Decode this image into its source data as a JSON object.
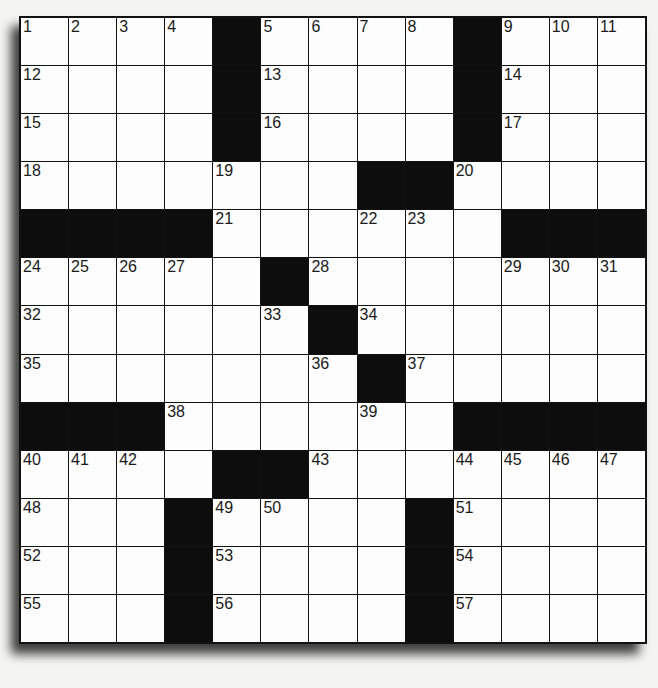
{
  "puzzle": {
    "size": 13,
    "colors": {
      "black": "#0d0d0d",
      "white": "#fdfdfd",
      "border": "#111111"
    },
    "grid": [
      [
        "1",
        "2",
        "3",
        "4",
        "#",
        "5",
        "6",
        "7",
        "8",
        "#",
        "9",
        "10",
        "11"
      ],
      [
        "12",
        "",
        "",
        "",
        "#",
        "13",
        "",
        "",
        "",
        "#",
        "14",
        "",
        ""
      ],
      [
        "15",
        "",
        "",
        "",
        "#",
        "16",
        "",
        "",
        "",
        "#",
        "17",
        "",
        ""
      ],
      [
        "18",
        "",
        "",
        "",
        "19",
        "",
        "",
        "#",
        "#",
        "20",
        "",
        "",
        ""
      ],
      [
        "#",
        "#",
        "#",
        "#",
        "21",
        "",
        "",
        "22",
        "23",
        "",
        "#",
        "#",
        "#"
      ],
      [
        "24",
        "25",
        "26",
        "27",
        "",
        "#",
        "28",
        "",
        "",
        "",
        "29",
        "30",
        "31"
      ],
      [
        "32",
        "",
        "",
        "",
        "",
        "33",
        "#",
        "34",
        "",
        "",
        "",
        "",
        ""
      ],
      [
        "35",
        "",
        "",
        "",
        "",
        "",
        "36",
        "#",
        "37",
        "",
        "",
        "",
        ""
      ],
      [
        "#",
        "#",
        "#",
        "38",
        "",
        "",
        "",
        "39",
        "",
        "#",
        "#",
        "#",
        "#"
      ],
      [
        "40",
        "41",
        "42",
        "",
        "#",
        "#",
        "43",
        "",
        "",
        "44",
        "45",
        "46",
        "47"
      ],
      [
        "48",
        "",
        "",
        "#",
        "49",
        "50",
        "",
        "",
        "#",
        "51",
        "",
        "",
        ""
      ],
      [
        "52",
        "",
        "",
        "#",
        "53",
        "",
        "",
        "",
        "#",
        "54",
        "",
        "",
        " "
      ],
      [
        "55",
        "",
        "",
        "#",
        "56",
        "",
        "",
        "",
        "#",
        "57",
        "",
        "",
        " "
      ]
    ]
  }
}
